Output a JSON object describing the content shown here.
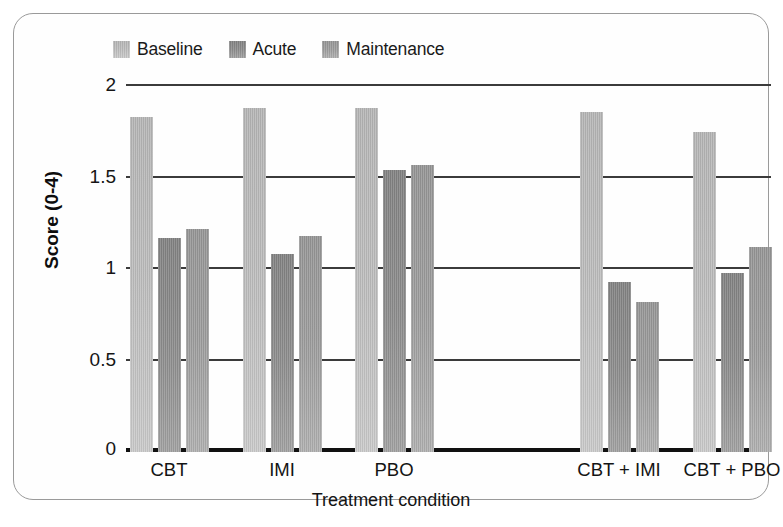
{
  "chart_data": {
    "type": "bar",
    "title": "",
    "xlabel": "Treatment condition",
    "ylabel": "Score (0-4)",
    "ylim": [
      0,
      2
    ],
    "yticks": [
      0,
      0.5,
      1,
      1.5,
      2
    ],
    "ytick_labels": [
      "0",
      "0.5",
      "1",
      "1.5",
      "2"
    ],
    "grid": true,
    "legend_position": "top-left",
    "categories": [
      "CBT",
      "IMI",
      "PBO",
      "CBT + IMI",
      "CBT + PBO"
    ],
    "series": [
      {
        "name": "Baseline",
        "color": "#bbbbbb",
        "values": [
          1.83,
          1.88,
          1.88,
          1.86,
          1.75
        ]
      },
      {
        "name": "Acute",
        "color": "#8d8d8d",
        "values": [
          1.17,
          1.08,
          1.54,
          0.93,
          0.98
        ]
      },
      {
        "name": "Maintenance",
        "color": "#9d9d9d",
        "values": [
          1.22,
          1.18,
          1.57,
          0.82,
          1.12
        ]
      }
    ]
  },
  "legend": {
    "items": [
      {
        "label": "Baseline"
      },
      {
        "label": "Acute"
      },
      {
        "label": "Maintenance"
      }
    ]
  },
  "axes": {
    "y_title": "Score (0-4)",
    "x_title": "Treatment condition",
    "y_ticks": [
      "2",
      "1.5",
      "1",
      "0.5",
      "0"
    ],
    "x_categories": [
      "CBT",
      "IMI",
      "PBO",
      "CBT + IMI",
      "CBT + PBO"
    ]
  }
}
